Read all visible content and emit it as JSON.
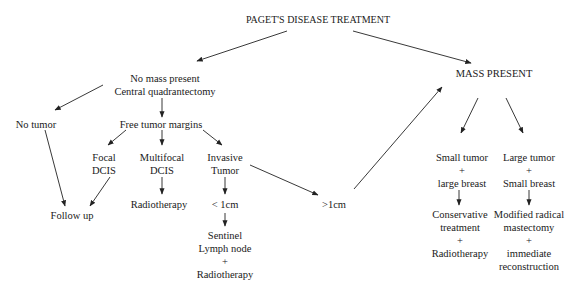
{
  "diagram": {
    "title": "PAGET'S DISEASE TREATMENT",
    "colors": {
      "text": "#1a1a1a",
      "line": "#222222",
      "background": "#ffffff"
    },
    "nodes": {
      "no_mass": {
        "line1": "No mass present",
        "line2": "Central quadrantectomy"
      },
      "no_tumor": {
        "label": "No tumor"
      },
      "free_margins": {
        "label": "Free tumor margins"
      },
      "focal_dcis": {
        "line1": "Focal",
        "line2": "DCIS"
      },
      "multifocal_dcis": {
        "line1": "Multifocal",
        "line2": "DCIS"
      },
      "invasive_tumor": {
        "line1": "Invasive",
        "line2": "Tumor"
      },
      "follow_up": {
        "label": "Follow up"
      },
      "radiotherapy": {
        "label": "Radiotherapy"
      },
      "lt_1cm": {
        "label": "< 1cm"
      },
      "sentinel": {
        "line1": "Sentinel",
        "line2": "Lymph node",
        "line3": "+",
        "line4": "Radiotherapy"
      },
      "gt_1cm": {
        "label": ">1cm"
      },
      "mass_present": {
        "label": "MASS PRESENT"
      },
      "small_tumor": {
        "line1": "Small tumor",
        "line2": "+",
        "line3": "large breast"
      },
      "large_tumor": {
        "line1": "Large tumor",
        "line2": "+",
        "line3": "Small breast"
      },
      "conservative": {
        "line1": "Conservative",
        "line2": "treatment",
        "line3": "+",
        "line4": "Radiotherapy"
      },
      "modified_radical": {
        "line1": "Modified radical",
        "line2": "mastectomy",
        "line3": "+",
        "line4": "immediate",
        "line5": "reconstruction"
      }
    },
    "edges": [
      {
        "from": "title",
        "to": "no_mass"
      },
      {
        "from": "title",
        "to": "mass_present"
      },
      {
        "from": "no_mass",
        "to": "no_tumor"
      },
      {
        "from": "no_mass",
        "to": "free_margins"
      },
      {
        "from": "free_margins",
        "to": "focal_dcis"
      },
      {
        "from": "free_margins",
        "to": "multifocal_dcis"
      },
      {
        "from": "free_margins",
        "to": "invasive_tumor"
      },
      {
        "from": "no_tumor",
        "to": "follow_up"
      },
      {
        "from": "focal_dcis",
        "to": "follow_up"
      },
      {
        "from": "multifocal_dcis",
        "to": "radiotherapy"
      },
      {
        "from": "invasive_tumor",
        "to": "lt_1cm"
      },
      {
        "from": "invasive_tumor",
        "to": "gt_1cm"
      },
      {
        "from": "lt_1cm",
        "to": "sentinel"
      },
      {
        "from": "gt_1cm",
        "to": "mass_present"
      },
      {
        "from": "mass_present",
        "to": "small_tumor"
      },
      {
        "from": "mass_present",
        "to": "large_tumor"
      },
      {
        "from": "small_tumor",
        "to": "conservative"
      },
      {
        "from": "large_tumor",
        "to": "modified_radical"
      }
    ]
  }
}
